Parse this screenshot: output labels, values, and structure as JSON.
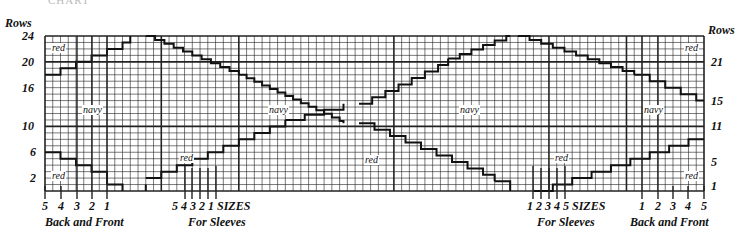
{
  "header": {
    "faint_title": "CHART",
    "left_axis_title": "Rows",
    "right_axis_title": "Rows"
  },
  "grid": {
    "left": 45,
    "top": 36,
    "right": 704,
    "bottom": 191,
    "columns": 85,
    "rows": 24,
    "heavy_columns": [
      0,
      15,
      25,
      45,
      65,
      75,
      85
    ],
    "heavy_rows": [
      0,
      10,
      20,
      24
    ],
    "line_color": "#222222"
  },
  "left_axis": {
    "ticks": [
      {
        "label": "24",
        "row": 24
      },
      {
        "label": "20",
        "row": 20
      },
      {
        "label": "16",
        "row": 16
      },
      {
        "label": "10",
        "row": 10
      },
      {
        "label": "6",
        "row": 6
      },
      {
        "label": "2",
        "row": 2
      }
    ]
  },
  "right_axis": {
    "ticks": [
      {
        "label": "21",
        "row": 20
      },
      {
        "label": "15",
        "row": 14
      },
      {
        "label": "11",
        "row": 10
      },
      {
        "label": "5",
        "row": 4.5
      },
      {
        "label": "1",
        "row": 0.8
      }
    ]
  },
  "color_labels": [
    {
      "text": "red",
      "x": 51,
      "y": 43
    },
    {
      "text": "navy",
      "x": 82,
      "y": 105
    },
    {
      "text": "red",
      "x": 179,
      "y": 153
    },
    {
      "text": "navy",
      "x": 268,
      "y": 105
    },
    {
      "text": "red",
      "x": 364,
      "y": 155
    },
    {
      "text": "navy",
      "x": 459,
      "y": 105
    },
    {
      "text": "red",
      "x": 554,
      "y": 153
    },
    {
      "text": "navy",
      "x": 643,
      "y": 105
    },
    {
      "text": "red",
      "x": 684,
      "y": 43
    },
    {
      "text": "red",
      "x": 51,
      "y": 171
    },
    {
      "text": "red",
      "x": 684,
      "y": 171
    }
  ],
  "size_markers": {
    "back_front_left": [
      {
        "label": "5",
        "x": 45,
        "top": 186
      },
      {
        "label": "4",
        "x": 61,
        "top": 186
      },
      {
        "label": "3",
        "x": 77,
        "top": 36
      },
      {
        "label": "2",
        "x": 92,
        "top": 36
      },
      {
        "label": "1",
        "x": 107,
        "top": 36
      }
    ],
    "sleeves_left": [
      {
        "label": "5",
        "x": 185,
        "top": 166
      },
      {
        "label": "4",
        "x": 192,
        "top": 168
      },
      {
        "label": "3",
        "x": 200,
        "top": 168
      },
      {
        "label": "2",
        "x": 208,
        "top": 168
      },
      {
        "label": "1",
        "x": 216,
        "top": 166
      }
    ],
    "sleeves_right": [
      {
        "label": "1",
        "x": 533,
        "top": 166
      },
      {
        "label": "2",
        "x": 541,
        "top": 168
      },
      {
        "label": "3",
        "x": 549,
        "top": 168
      },
      {
        "label": "4",
        "x": 557,
        "top": 168
      },
      {
        "label": "5",
        "x": 565,
        "top": 166
      }
    ],
    "back_front_right": [
      {
        "label": "1",
        "x": 642,
        "top": 36
      },
      {
        "label": "2",
        "x": 658,
        "top": 36
      },
      {
        "label": "3",
        "x": 673,
        "top": 186
      },
      {
        "label": "4",
        "x": 688,
        "top": 186
      },
      {
        "label": "5",
        "x": 704,
        "top": 186
      }
    ]
  },
  "bottom_labels": {
    "sizes_left": "SIZES",
    "sizes_right": "SIZES",
    "back_front_left": "Back and Front",
    "for_sleeves_left": "For Sleeves",
    "for_sleeves_right": "For Sleeves",
    "back_front_right": "Back and Front"
  },
  "stairs": [
    {
      "from": [
        0,
        18
      ],
      "to": [
        11,
        24
      ],
      "dx": 2,
      "dy": 1
    },
    {
      "from": [
        13,
        24
      ],
      "to": [
        25,
        18
      ],
      "dx": 1.2,
      "dy": -0.6
    },
    {
      "from": [
        25,
        18
      ],
      "to": [
        38.5,
        10.5
      ],
      "dx": 1,
      "dy": -0.55
    },
    {
      "from": [
        0,
        6
      ],
      "to": [
        8,
        1
      ],
      "dx": 2,
      "dy": -1
    },
    {
      "from": [
        8,
        1
      ],
      "to": [
        10,
        0
      ],
      "dx": 2,
      "dy": -1
    },
    {
      "from": [
        13,
        0
      ],
      "to": [
        13,
        1
      ],
      "dx": 0,
      "dy": 1
    },
    {
      "from": [
        13,
        2
      ],
      "to": [
        31,
        11
      ],
      "dx": 2,
      "dy": 1
    },
    {
      "from": [
        31,
        11
      ],
      "to": [
        38.5,
        13.5
      ],
      "dx": 2.5,
      "dy": 0.8
    },
    {
      "from": [
        40.5,
        13.5
      ],
      "to": [
        52,
        20.5
      ],
      "dx": 1.7,
      "dy": 1
    },
    {
      "from": [
        52,
        20.5
      ],
      "to": [
        60,
        24
      ],
      "dx": 1.5,
      "dy": 0.7
    },
    {
      "from": [
        61,
        24
      ],
      "to": [
        76,
        18
      ],
      "dx": 1.5,
      "dy": -0.6
    },
    {
      "from": [
        76,
        18
      ],
      "to": [
        85,
        14
      ],
      "dx": 2,
      "dy": -1
    },
    {
      "from": [
        40.5,
        10.5
      ],
      "to": [
        58,
        1.5
      ],
      "dx": 2,
      "dy": -1
    },
    {
      "from": [
        58,
        1.5
      ],
      "to": [
        60,
        0
      ],
      "dx": 2,
      "dy": -1.5
    },
    {
      "from": [
        63,
        0
      ],
      "to": [
        85,
        8
      ],
      "dx": 2.5,
      "dy": 1
    }
  ],
  "diamonds": [
    {
      "top_gap": [
        22.5,
        24
      ],
      "bottom_gap": [
        22.5,
        24
      ]
    }
  ],
  "chart_data": {
    "type": "diagram",
    "columns": 85,
    "rows": 24,
    "left_row_labels": [
      24,
      20,
      16,
      10,
      6,
      2
    ],
    "right_row_labels": [
      21,
      15,
      11,
      5,
      1
    ],
    "regions": [
      "red",
      "navy",
      "red",
      "navy",
      "red",
      "navy",
      "red",
      "navy",
      "red"
    ],
    "size_lines": {
      "back_and_front": [
        5,
        4,
        3,
        2,
        1
      ],
      "for_sleeves": [
        5,
        4,
        3,
        2,
        1
      ]
    }
  }
}
